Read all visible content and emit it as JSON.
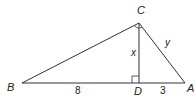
{
  "diagram": {
    "type": "right-triangle-with-altitude",
    "vertices": {
      "A": {
        "label": "A"
      },
      "B": {
        "label": "B"
      },
      "C": {
        "label": "C"
      },
      "D": {
        "label": "D"
      }
    },
    "segments": {
      "BD": {
        "label": "8"
      },
      "DA": {
        "label": "3"
      },
      "CD": {
        "label": "x"
      },
      "CA": {
        "label": "y"
      }
    },
    "markers": {
      "right_angle_at_C": true,
      "right_angle_at_D": true
    },
    "colors": {
      "stroke": "#333333",
      "text": "#222222",
      "background": "#ffffff"
    }
  }
}
